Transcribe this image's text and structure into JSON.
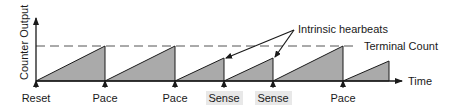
{
  "diagram": {
    "y_axis_label": "Counter Output",
    "x_axis_label": "Time",
    "threshold_label": "Terminal Count",
    "annotation_label": "Intrinsic hearbeats",
    "events": [
      {
        "label": "Reset",
        "x": 36,
        "type": "reset"
      },
      {
        "label": "Pace",
        "x": 105,
        "type": "pace"
      },
      {
        "label": "Pace",
        "x": 175,
        "type": "pace"
      },
      {
        "label": "Sense",
        "x": 224,
        "type": "sense"
      },
      {
        "label": "Sense",
        "x": 273,
        "type": "sense"
      },
      {
        "label": "Pace",
        "x": 343,
        "type": "pace"
      }
    ],
    "ramps": [
      {
        "x0": 36,
        "x1": 105,
        "peak_y": 46
      },
      {
        "x0": 105,
        "x1": 175,
        "peak_y": 46
      },
      {
        "x0": 175,
        "x1": 224,
        "peak_y": 58
      },
      {
        "x0": 224,
        "x1": 273,
        "peak_y": 58
      },
      {
        "x0": 273,
        "x1": 343,
        "peak_y": 46
      },
      {
        "x0": 343,
        "x1": 389,
        "peak_y": 61
      }
    ],
    "colors": {
      "fill": "#aaaaaa",
      "stroke": "#1a1a1a",
      "dash": "#555555",
      "sense_bg": "#e8e8e8"
    }
  }
}
